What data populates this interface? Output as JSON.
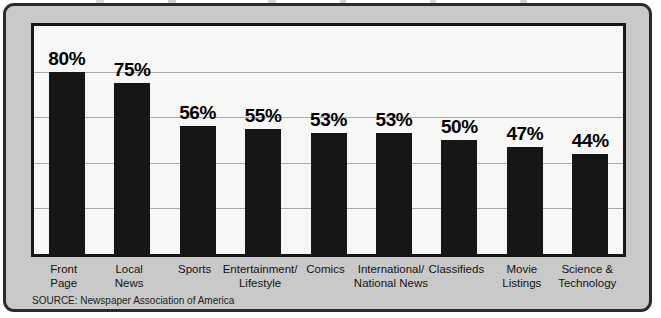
{
  "chart_data": {
    "type": "bar",
    "title": "",
    "subtitle": "",
    "xlabel": "",
    "ylabel": "",
    "ylim": [
      0,
      100
    ],
    "gridlines": [
      20,
      40,
      60,
      80
    ],
    "grid": true,
    "legend": "none",
    "value_suffix": "%",
    "bar_color": "#161616",
    "categories": [
      "Front Page",
      "Local News",
      "Sports",
      "Entertainment/ Lifestyle",
      "Comics",
      "International/ National News",
      "Classifieds",
      "Movie Listings",
      "Science & Technology"
    ],
    "category_lines": [
      [
        "Front",
        "Page"
      ],
      [
        "Local",
        "News"
      ],
      [
        "Sports",
        ""
      ],
      [
        "Entertainment/",
        "Lifestyle"
      ],
      [
        "Comics",
        ""
      ],
      [
        "International/",
        "National News"
      ],
      [
        "Classifieds",
        ""
      ],
      [
        "Movie",
        "Listings"
      ],
      [
        "Science &",
        "Technology"
      ]
    ],
    "values": [
      80,
      75,
      56,
      55,
      53,
      53,
      50,
      47,
      44
    ],
    "value_labels": [
      "80%",
      "75%",
      "56%",
      "55%",
      "53%",
      "53%",
      "50%",
      "47%",
      "44%"
    ]
  },
  "source": {
    "text": "SOURCE: Newspaper Association of America"
  },
  "colors": {
    "panel_background": "#c9c9c9",
    "plot_background": "#f7f7f5",
    "frame": "#171717",
    "bar": "#161616",
    "gridline": "#a9a9a9"
  }
}
